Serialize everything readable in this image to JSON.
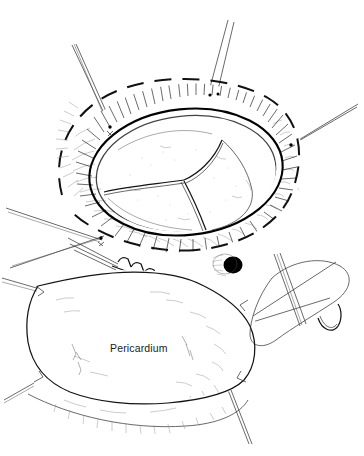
{
  "figure": {
    "domain": "medical-line-illustration",
    "technique": "pen-and-ink stipple and hatch drawing",
    "canvas": {
      "width": 364,
      "height": 456
    },
    "background_color": "#ffffff",
    "ink_color": "#1a1a1a",
    "accent_color": "#000000"
  },
  "labels": [
    {
      "id": "pericardium",
      "text": "Pericardium",
      "x": 110,
      "y": 352,
      "font_size": 10.5,
      "anchor": "start"
    }
  ],
  "structures": {
    "aortotomy_margin": {
      "name": "dashed incision margin",
      "style": "dashed-oval",
      "dash_pattern": "17 11",
      "stroke_width": 2.0
    },
    "aortic_wall": {
      "name": "everted aortic wall with hatched cut edge"
    },
    "valve": {
      "name": "trileaflet aortic valve",
      "cusp_count": 3,
      "cusps": [
        "left cusp",
        "right cusp",
        "posterior cusp"
      ]
    },
    "coronary_ostium": {
      "name": "coronary ostium",
      "cx": 232,
      "cy": 265,
      "r": 9,
      "fill": "#000000"
    },
    "pericardial_patch": {
      "name": "pericardial patch",
      "suture_line": "running suture along superior patch edge",
      "stitch_count": 7
    },
    "suture_loop": {
      "name": "suture loop with needle",
      "location": "right lower field"
    }
  },
  "stay_sutures": [
    {
      "id": "stay-upper-left",
      "anchor_x": 108,
      "anchor_y": 125,
      "tip_x": 72,
      "tip_y": 45
    },
    {
      "id": "stay-top-a",
      "anchor_x": 208,
      "anchor_y": 94,
      "tip_x": 228,
      "tip_y": 20
    },
    {
      "id": "stay-top-b",
      "anchor_x": 216,
      "anchor_y": 93,
      "tip_x": 234,
      "tip_y": 22
    },
    {
      "id": "stay-right",
      "anchor_x": 292,
      "anchor_y": 143,
      "tip_x": 358,
      "tip_y": 104
    },
    {
      "id": "stay-right-low",
      "anchor_x": 292,
      "anchor_y": 147,
      "tip_x": 296,
      "tip_y": 188
    },
    {
      "id": "stay-left-a",
      "anchor_x": 98,
      "anchor_y": 236,
      "tip_x": 6,
      "tip_y": 208
    },
    {
      "id": "stay-left-b",
      "anchor_x": 100,
      "anchor_y": 238,
      "tip_x": 10,
      "tip_y": 268
    },
    {
      "id": "stay-left-patch",
      "anchor_x": 38,
      "anchor_y": 288,
      "tip_x": 2,
      "tip_y": 278
    },
    {
      "id": "stay-lower-left",
      "anchor_x": 32,
      "anchor_y": 383,
      "tip_x": 4,
      "tip_y": 400
    },
    {
      "id": "stay-lower-right",
      "anchor_x": 228,
      "anchor_y": 390,
      "tip_x": 248,
      "tip_y": 444
    },
    {
      "id": "stay-mid-right",
      "anchor_x": 250,
      "anchor_y": 322,
      "tip_x": 330,
      "tip_y": 300
    }
  ]
}
